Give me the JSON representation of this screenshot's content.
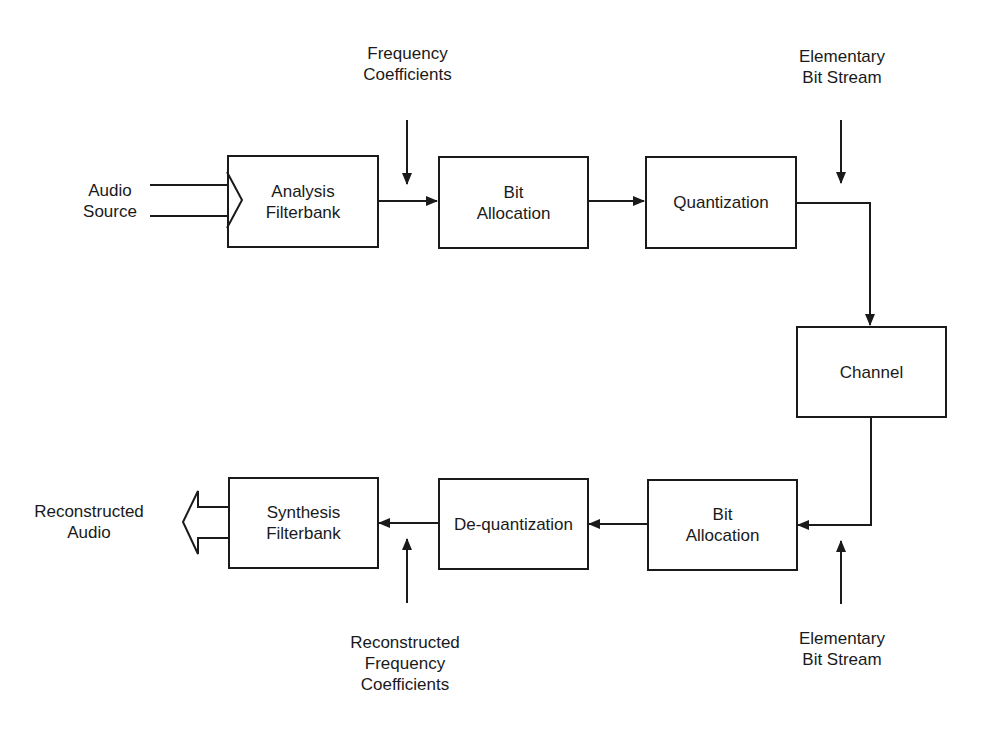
{
  "diagram": {
    "type": "block-diagram",
    "colors": {
      "stroke": "#1a1a1a",
      "background": "#ffffff",
      "text": "#1a1a1a"
    },
    "encoder": {
      "input_label": {
        "line1": "Audio",
        "line2": "Source"
      },
      "analysis_filterbank": {
        "line1": "Analysis",
        "line2": "Filterbank"
      },
      "bit_allocation": {
        "line1": "Bit",
        "line2": "Allocation"
      },
      "quantization": {
        "line1": "Quantization"
      },
      "frequency_coefficients": {
        "line1": "Frequency",
        "line2": "Coefficients"
      },
      "elementary_bit_stream": {
        "line1": "Elementary",
        "line2": "Bit Stream"
      }
    },
    "channel": {
      "line1": "Channel"
    },
    "decoder": {
      "bit_allocation": {
        "line1": "Bit",
        "line2": "Allocation"
      },
      "dequantization": {
        "line1": "De-quantization"
      },
      "synthesis_filterbank": {
        "line1": "Synthesis",
        "line2": "Filterbank"
      },
      "output_label": {
        "line1": "Reconstructed",
        "line2": "Audio"
      },
      "reconstructed_frequency_coefficients": {
        "line1": "Reconstructed",
        "line2": "Frequency",
        "line3": "Coefficients"
      },
      "elementary_bit_stream": {
        "line1": "Elementary",
        "line2": "Bit Stream"
      }
    },
    "edges": [
      {
        "from": "Audio Source",
        "to": "Analysis Filterbank",
        "style": "wide-arrow"
      },
      {
        "from": "Analysis Filterbank",
        "to": "Bit Allocation"
      },
      {
        "from": "Frequency Coefficients",
        "to": "Bit Allocation"
      },
      {
        "from": "Bit Allocation",
        "to": "Quantization"
      },
      {
        "from": "Elementary Bit Stream",
        "to": "Quantization output"
      },
      {
        "from": "Quantization",
        "to": "Channel"
      },
      {
        "from": "Channel",
        "to": "Bit Allocation (decoder)"
      },
      {
        "from": "Elementary Bit Stream (decoder)",
        "to": "Channel output"
      },
      {
        "from": "Bit Allocation (decoder)",
        "to": "De-quantization"
      },
      {
        "from": "De-quantization",
        "to": "Synthesis Filterbank"
      },
      {
        "from": "Reconstructed Frequency Coefficients",
        "to": "Synthesis Filterbank input"
      },
      {
        "from": "Synthesis Filterbank",
        "to": "Reconstructed Audio",
        "style": "wide-arrow"
      }
    ]
  }
}
